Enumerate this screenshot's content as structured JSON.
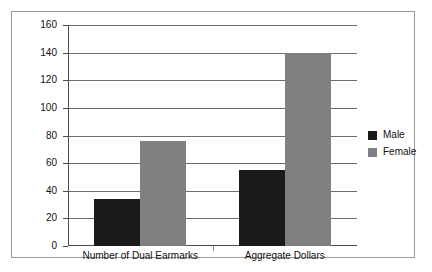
{
  "chart_data": {
    "type": "bar",
    "title": "",
    "xlabel": "",
    "ylabel": "",
    "ylim": [
      0,
      160
    ],
    "yticks": [
      0,
      20,
      40,
      60,
      80,
      100,
      120,
      140,
      160
    ],
    "grid": true,
    "legend_position": "right",
    "categories": [
      "Number of Dual Earmarks",
      "Aggregate Dollars"
    ],
    "series": [
      {
        "name": "Male",
        "color": "#1a1a1a",
        "values": [
          34,
          55
        ]
      },
      {
        "name": "Female",
        "color": "#808080",
        "values": [
          76,
          140
        ]
      }
    ]
  },
  "legend": {
    "items": [
      {
        "label": "Male"
      },
      {
        "label": "Female"
      }
    ]
  },
  "axis": {
    "tick_labels": [
      "0",
      "20",
      "40",
      "60",
      "80",
      "100",
      "120",
      "140",
      "160"
    ]
  }
}
